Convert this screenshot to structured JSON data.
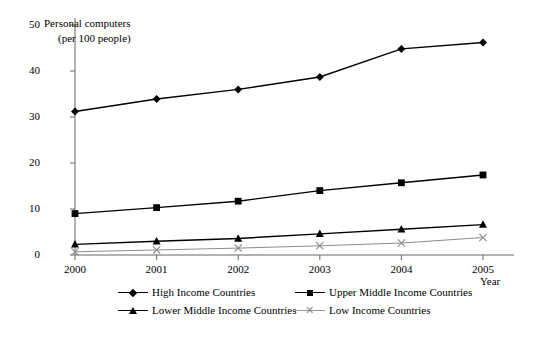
{
  "chart_data": {
    "type": "line",
    "title": "Personal computers (per 100 people)",
    "title_line1": "Personal computers",
    "title_line2": "(per 100 people)",
    "xlabel": "Year",
    "ylabel": "",
    "categories": [
      "2000",
      "2001",
      "2002",
      "2003",
      "2004",
      "2005"
    ],
    "x": [
      2000,
      2001,
      2002,
      2003,
      2004,
      2005
    ],
    "ylim": [
      0,
      50
    ],
    "xlim": [
      2000,
      2005
    ],
    "yticks": [
      0,
      10,
      20,
      30,
      40,
      50
    ],
    "grid": false,
    "legend_position": "bottom",
    "series": [
      {
        "name": "High Income Countries",
        "marker": "diamond",
        "color": "#000000",
        "values": [
          31.2,
          33.9,
          36.0,
          38.7,
          44.8,
          46.2
        ]
      },
      {
        "name": "Upper Middle Income Countries",
        "marker": "square",
        "color": "#000000",
        "values": [
          9.0,
          10.3,
          11.7,
          14.0,
          15.7,
          17.4
        ]
      },
      {
        "name": "Lower Middle Income Countries",
        "marker": "triangle",
        "color": "#000000",
        "values": [
          2.3,
          3.0,
          3.6,
          4.6,
          5.6,
          6.6
        ]
      },
      {
        "name": "Low Income Countries",
        "marker": "x",
        "color": "#8d8d8d",
        "values": [
          0.7,
          1.1,
          1.5,
          2.0,
          2.6,
          3.8
        ]
      }
    ]
  },
  "axis": {
    "y_tick_labels": [
      "50",
      "40",
      "30",
      "20",
      "10",
      "0"
    ],
    "x_tick_labels": [
      "2000",
      "2001",
      "2002",
      "2003",
      "2004",
      "2005"
    ],
    "x_axis_caption": "Year"
  },
  "legend": {
    "items": [
      {
        "label": "High Income Countries",
        "marker": "diamond"
      },
      {
        "label": "Upper Middle Income Countries",
        "marker": "square"
      },
      {
        "label": "Lower Middle Income Countries",
        "marker": "triangle"
      },
      {
        "label": "Low Income Countries",
        "marker": "x"
      }
    ]
  }
}
